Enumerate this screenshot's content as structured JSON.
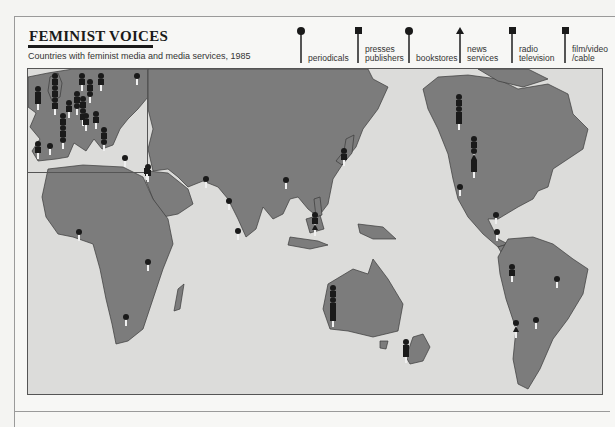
{
  "header": {
    "title": "FEMINIST VOICES",
    "subtitle": "Countries with feminist media and media services, 1985"
  },
  "legend": {
    "items": [
      {
        "key": "periodicals",
        "label": "periodicals",
        "marker": "circle",
        "x": 297
      },
      {
        "key": "presses",
        "label": "presses\npublishers",
        "marker": "square",
        "x": 354
      },
      {
        "key": "bookstores",
        "label": "bookstores",
        "marker": "circle",
        "x": 405
      },
      {
        "key": "news",
        "label": "news\nservices",
        "marker": "triangle",
        "x": 456
      },
      {
        "key": "radio",
        "label": "radio\ntelevision",
        "marker": "square",
        "x": 508
      },
      {
        "key": "film",
        "label": "film/video\n/cable",
        "marker": "square",
        "x": 561
      }
    ]
  },
  "colors": {
    "land": "#7c7c7c",
    "sea": "#dcdcda",
    "border": "#3a3a3a",
    "marker": "#1a1a1a",
    "page": "#f7f7f5"
  },
  "map": {
    "inset_label": "Europe (enlarged)",
    "pins": [
      {
        "region": "Ireland",
        "x": 38,
        "y": 86,
        "markers": [
          "circle",
          "square",
          "square"
        ]
      },
      {
        "region": "United Kingdom",
        "x": 55,
        "y": 73,
        "markers": [
          "circle",
          "square",
          "circle",
          "square",
          "circle",
          "square"
        ]
      },
      {
        "region": "Norway",
        "x": 82,
        "y": 73,
        "markers": [
          "circle",
          "square"
        ]
      },
      {
        "region": "Sweden",
        "x": 101,
        "y": 73,
        "markers": [
          "circle",
          "square"
        ]
      },
      {
        "region": "Finland",
        "x": 137,
        "y": 73,
        "markers": [
          "circle"
        ]
      },
      {
        "region": "Denmark",
        "x": 90,
        "y": 79,
        "markers": [
          "circle",
          "square",
          "circle"
        ]
      },
      {
        "region": "Netherlands",
        "x": 77,
        "y": 91,
        "markers": [
          "circle",
          "square",
          "circle"
        ]
      },
      {
        "region": "Germany",
        "x": 83,
        "y": 96,
        "markers": [
          "circle",
          "square",
          "circle",
          "square"
        ]
      },
      {
        "region": "Belgium",
        "x": 69,
        "y": 100,
        "markers": [
          "circle",
          "square"
        ]
      },
      {
        "region": "France",
        "x": 63,
        "y": 113,
        "markers": [
          "circle",
          "square",
          "circle",
          "square",
          "circle"
        ]
      },
      {
        "region": "Switzerland",
        "x": 86,
        "y": 113,
        "markers": [
          "circle",
          "square"
        ]
      },
      {
        "region": "Austria",
        "x": 96,
        "y": 111,
        "markers": [
          "circle",
          "square"
        ]
      },
      {
        "region": "Italy",
        "x": 104,
        "y": 127,
        "markers": [
          "circle",
          "square",
          "circle"
        ]
      },
      {
        "region": "Portugal",
        "x": 38,
        "y": 141,
        "markers": [
          "circle",
          "square"
        ]
      },
      {
        "region": "Spain",
        "x": 50,
        "y": 143,
        "markers": [
          "circle"
        ]
      },
      {
        "region": "Greece",
        "x": 125,
        "y": 155,
        "markers": [
          "circle"
        ]
      },
      {
        "region": "Turkey",
        "x": 148,
        "y": 164,
        "markers": [
          "circle",
          "square"
        ]
      },
      {
        "region": "Israel",
        "x": 147,
        "y": 168,
        "markers": [
          "square"
        ]
      },
      {
        "region": "Pakistan",
        "x": 206,
        "y": 176,
        "markers": [
          "circle"
        ]
      },
      {
        "region": "India",
        "x": 229,
        "y": 198,
        "markers": [
          "circle"
        ]
      },
      {
        "region": "Sri Lanka",
        "x": 238,
        "y": 228,
        "markers": [
          "circle"
        ]
      },
      {
        "region": "China",
        "x": 286,
        "y": 177,
        "markers": [
          "circle"
        ]
      },
      {
        "region": "Japan",
        "x": 344,
        "y": 148,
        "markers": [
          "circle",
          "square"
        ]
      },
      {
        "region": "Philippines",
        "x": 315,
        "y": 212,
        "markers": [
          "circle",
          "square",
          "triangle"
        ]
      },
      {
        "region": "Nigeria",
        "x": 79,
        "y": 229,
        "markers": [
          "circle"
        ]
      },
      {
        "region": "Kenya",
        "x": 148,
        "y": 259,
        "markers": [
          "circle"
        ]
      },
      {
        "region": "South Africa",
        "x": 126,
        "y": 314,
        "markers": [
          "circle"
        ]
      },
      {
        "region": "Australia",
        "x": 333,
        "y": 285,
        "markers": [
          "circle",
          "square",
          "circle",
          "square",
          "square",
          "square"
        ]
      },
      {
        "region": "New Zealand",
        "x": 406,
        "y": 339,
        "markers": [
          "circle",
          "square",
          "square"
        ]
      },
      {
        "region": "Canada",
        "x": 459,
        "y": 94,
        "markers": [
          "circle",
          "square",
          "circle",
          "square",
          "square"
        ]
      },
      {
        "region": "United States",
        "x": 474,
        "y": 136,
        "markers": [
          "circle",
          "square",
          "circle",
          "triangle",
          "square",
          "square"
        ]
      },
      {
        "region": "Mexico",
        "x": 460,
        "y": 184,
        "markers": [
          "circle"
        ]
      },
      {
        "region": "Costa Rica",
        "x": 496,
        "y": 212,
        "markers": [
          "circle"
        ]
      },
      {
        "region": "Colombia",
        "x": 497,
        "y": 229,
        "markers": [
          "circle"
        ]
      },
      {
        "region": "Peru",
        "x": 512,
        "y": 264,
        "markers": [
          "circle",
          "square"
        ]
      },
      {
        "region": "Brazil",
        "x": 557,
        "y": 276,
        "markers": [
          "circle"
        ]
      },
      {
        "region": "Argentina",
        "x": 536,
        "y": 317,
        "markers": [
          "circle"
        ]
      },
      {
        "region": "Chile",
        "x": 516,
        "y": 320,
        "markers": [
          "circle",
          "triangle"
        ]
      }
    ]
  }
}
